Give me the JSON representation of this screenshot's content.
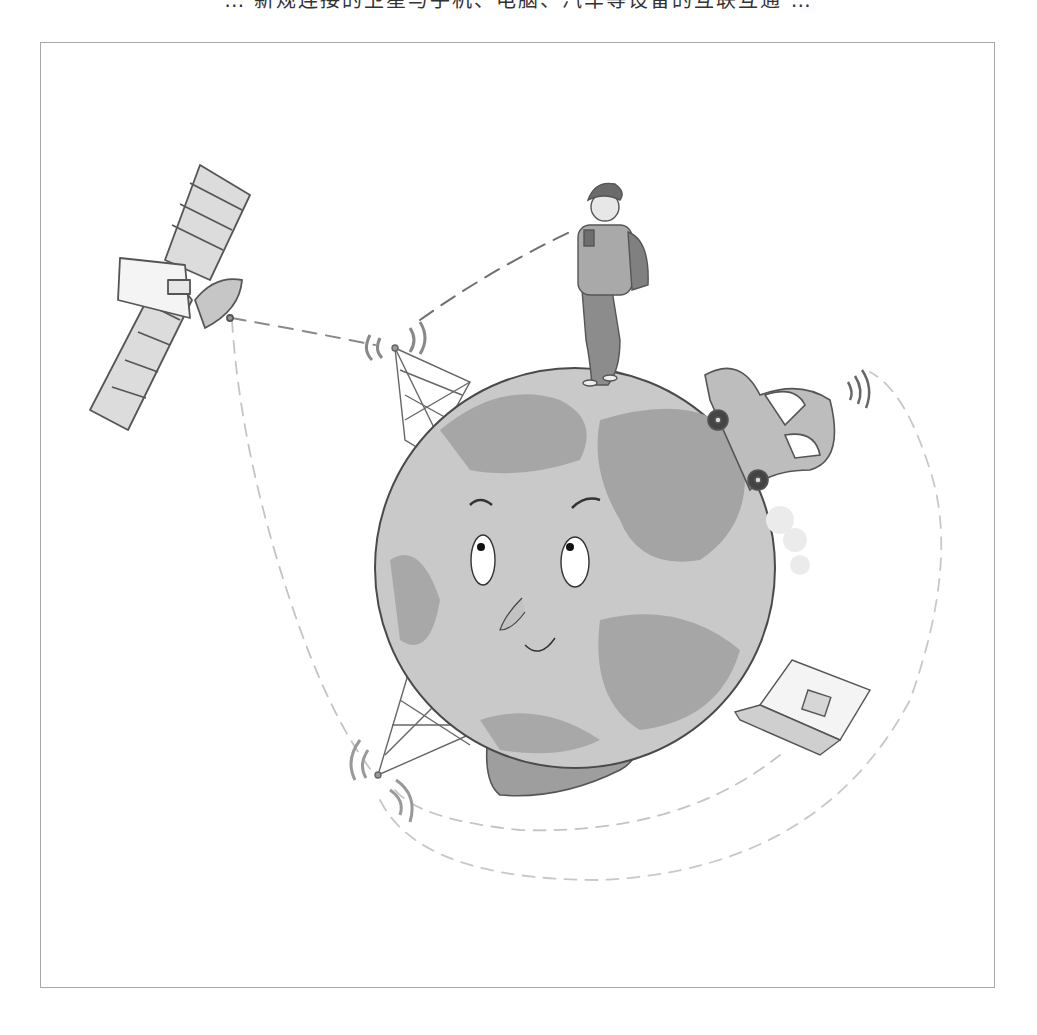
{
  "caption": {
    "text": "… 新规连接的卫星与手机、电脑、汽车等设备的互联互通 …"
  },
  "illustration": {
    "subject": "cartoon-earth-connected-network",
    "elements": [
      {
        "name": "satellite",
        "label": "satellite"
      },
      {
        "name": "person-with-phone",
        "label": "person with phone"
      },
      {
        "name": "earth-globe-character",
        "label": "smiling earth character with crossed arms"
      },
      {
        "name": "car",
        "label": "car with antenna"
      },
      {
        "name": "laptop",
        "label": "laptop"
      },
      {
        "name": "signal-tower-top",
        "label": "signal tower"
      },
      {
        "name": "signal-tower-bottom",
        "label": "signal tower"
      }
    ],
    "colors": {
      "background": "#ffffff",
      "frame": "#a8a8a8",
      "globe_light": "#c9c9c9",
      "globe_dark": "#a2a2a2",
      "outline": "#555555",
      "dash": "#b8b8b8",
      "dash_dark": "#707070"
    }
  }
}
